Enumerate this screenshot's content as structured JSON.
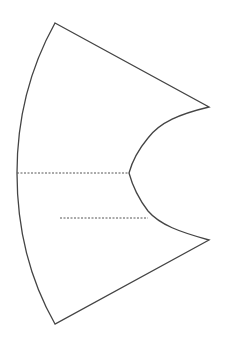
{
  "diagram": {
    "type": "pattern-piece",
    "colors": {
      "background": "#ffffff",
      "outline": "#444444",
      "dashed": "#555555"
    },
    "points": {
      "top": [
        55,
        23
      ],
      "upper_right": [
        209,
        107
      ],
      "notch": [
        129,
        173
      ],
      "lower_right": [
        209,
        240
      ],
      "bottom": [
        55,
        324
      ],
      "left_mid": [
        17,
        173
      ]
    },
    "guides": [
      {
        "name": "center-line",
        "from": [
          17,
          173
        ],
        "to": [
          129,
          173
        ]
      },
      {
        "name": "inner-line",
        "from": [
          60,
          218
        ],
        "to": [
          148,
          218
        ]
      }
    ]
  }
}
